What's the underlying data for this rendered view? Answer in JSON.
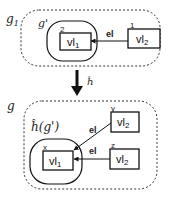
{
  "top": {
    "outer_label": "g",
    "outer_label_sub": "1",
    "inner_label": "g'",
    "nodes": [
      {
        "id": "2",
        "label": "vl",
        "sub": "1"
      },
      {
        "id": "1",
        "label": "vl",
        "sub": "2"
      }
    ],
    "edges": [
      {
        "from": "1",
        "to": "2",
        "label": "el"
      }
    ]
  },
  "mapping": {
    "label": "ĥ"
  },
  "bottom": {
    "outer_label": "g",
    "inner_label": "ĥ(g')",
    "nodes": [
      {
        "id": "x",
        "label": "vl",
        "sub": "1"
      },
      {
        "id": "y",
        "label": "vl",
        "sub": "2"
      },
      {
        "id": "z",
        "label": "vl",
        "sub": "2"
      }
    ],
    "edges": [
      {
        "from": "y",
        "to": "x",
        "label": "el"
      },
      {
        "from": "z",
        "to": "x",
        "label": "el"
      }
    ]
  }
}
